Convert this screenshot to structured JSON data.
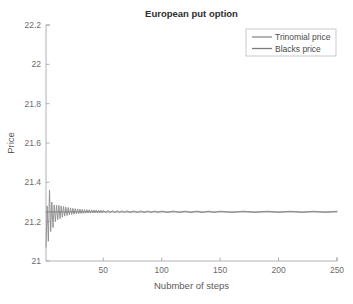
{
  "figure": {
    "width": 353,
    "height": 304,
    "background": "#ffffff"
  },
  "chart_data": {
    "type": "line",
    "title": "European put option",
    "xlabel": "Nubmber of steps",
    "ylabel": "Price",
    "xlim": [
      1,
      250
    ],
    "ylim": [
      21,
      22.2
    ],
    "xticks": [
      50,
      100,
      150,
      200,
      250
    ],
    "xticklabels": [
      "50",
      "100",
      "150",
      "200",
      "250"
    ],
    "yticks": [
      21,
      21.2,
      21.4,
      21.6,
      21.8,
      22,
      22.2
    ],
    "yticklabels": [
      "21",
      "21.2",
      "21.4",
      "21.6",
      "21.8",
      "22",
      "22.2"
    ],
    "grid": false,
    "legend_position": "top-right",
    "series": [
      {
        "name": "Trinomial price",
        "color": "#8c8c8c",
        "x": [
          1,
          2,
          3,
          4,
          5,
          6,
          7,
          8,
          9,
          10,
          11,
          12,
          13,
          14,
          15,
          16,
          17,
          18,
          19,
          20,
          21,
          22,
          23,
          24,
          25,
          26,
          27,
          28,
          29,
          30,
          31,
          32,
          33,
          34,
          35,
          36,
          37,
          38,
          39,
          40,
          41,
          42,
          43,
          44,
          45,
          46,
          47,
          48,
          49,
          50,
          52,
          54,
          56,
          58,
          60,
          62,
          64,
          66,
          68,
          70,
          73,
          76,
          79,
          82,
          85,
          88,
          91,
          94,
          97,
          100,
          105,
          110,
          115,
          120,
          125,
          130,
          135,
          140,
          145,
          150,
          160,
          170,
          180,
          190,
          200,
          210,
          220,
          230,
          240,
          250
        ],
        "y": [
          21.07,
          21.28,
          21.1,
          21.36,
          21.15,
          21.3,
          21.17,
          21.285,
          21.2,
          21.283,
          21.21,
          21.283,
          21.215,
          21.28,
          21.222,
          21.277,
          21.228,
          21.274,
          21.231,
          21.272,
          21.234,
          21.27,
          21.236,
          21.268,
          21.238,
          21.266,
          21.24,
          21.265,
          21.241,
          21.264,
          21.242,
          21.263,
          21.243,
          21.262,
          21.2435,
          21.261,
          21.244,
          21.2605,
          21.2443,
          21.26,
          21.2445,
          21.2595,
          21.2447,
          21.259,
          21.245,
          21.2585,
          21.2452,
          21.258,
          21.2454,
          21.2578,
          21.2455,
          21.2572,
          21.2457,
          21.2568,
          21.2458,
          21.2564,
          21.2459,
          21.256,
          21.246,
          21.2557,
          21.2461,
          21.2553,
          21.2462,
          21.255,
          21.2463,
          21.2548,
          21.2464,
          21.2546,
          21.2464,
          21.2544,
          21.2465,
          21.2542,
          21.2466,
          21.254,
          21.2466,
          21.2538,
          21.2467,
          21.2537,
          21.2467,
          21.2536,
          21.2468,
          21.2534,
          21.2468,
          21.2533,
          21.2469,
          21.2532,
          21.2469,
          21.2531,
          21.247,
          21.253
        ]
      },
      {
        "name": "Blacks price",
        "color": "#7d7d7d",
        "x": [
          1,
          250
        ],
        "y": [
          21.2495,
          21.2495
        ]
      }
    ]
  },
  "legend": {
    "entries": [
      {
        "label": "Trinomial price",
        "color": "#8c8c8c"
      },
      {
        "label": "Blacks price",
        "color": "#7d7d7d"
      }
    ]
  },
  "axes_geometry": {
    "left": 46,
    "right": 337,
    "top": 25,
    "bottom": 261
  },
  "legend_geometry": {
    "x": 246,
    "y": 29,
    "width": 90,
    "height": 27
  },
  "colors": {
    "axis": "#9aa0a6",
    "tick_text": "#6b6b6b",
    "title_text": "#2e2e2e",
    "label_text": "#5a5a5a",
    "legend_border": "#b9bcc0",
    "background": "#ffffff"
  }
}
